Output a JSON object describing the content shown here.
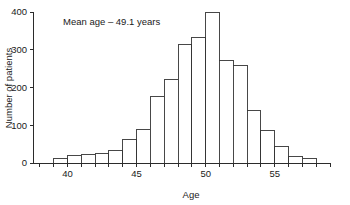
{
  "chart_data": {
    "type": "bar",
    "title": "",
    "subtitle": "",
    "xlabel": "Age",
    "ylabel": "Number of patients",
    "xlim": [
      37.5,
      59
    ],
    "ylim": [
      0,
      400
    ],
    "grid": false,
    "legend": null,
    "bin_width": 1,
    "annotations": [
      {
        "name": "mean-age-annotation",
        "text": "Mean age – 49.1 years",
        "x": 41.5,
        "y": 380
      }
    ],
    "xticks": [
      40,
      45,
      50,
      55
    ],
    "xtick_labels": [
      "40",
      "45",
      "50",
      "55"
    ],
    "yticks": [
      0,
      100,
      200,
      300,
      400
    ],
    "ytick_labels": [
      "0",
      "100",
      "200",
      "300",
      "400"
    ],
    "categories": [
      "39",
      "40",
      "41",
      "42",
      "43",
      "44",
      "45",
      "46",
      "47",
      "48",
      "49",
      "50",
      "51",
      "52",
      "53",
      "54",
      "55",
      "56",
      "57"
    ],
    "bin_starts": [
      39,
      40,
      41,
      42,
      43,
      44,
      45,
      46,
      47,
      48,
      49,
      50,
      51,
      52,
      53,
      54,
      55,
      56,
      57
    ],
    "values": [
      11,
      20,
      23,
      25,
      34,
      62,
      89,
      175,
      221,
      314,
      332,
      400,
      271,
      257,
      139,
      87,
      44,
      17,
      12
    ],
    "series": [
      {
        "name": "Number of patients",
        "values": [
          11,
          20,
          23,
          25,
          34,
          62,
          89,
          175,
          221,
          314,
          332,
          400,
          271,
          257,
          139,
          87,
          44,
          17,
          12
        ]
      }
    ],
    "mean_age": 49.1,
    "colors": {
      "bar_fill": "#ffffff",
      "bar_stroke": "#333333",
      "axis": "#2b2b2b",
      "text": "#1a1a1a",
      "background": "#ffffff"
    }
  }
}
